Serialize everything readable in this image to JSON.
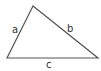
{
  "diagram": {
    "type": "triangle",
    "stroke_color": "#555555",
    "vertices": {
      "top": [
        33,
        6
      ],
      "bottom_left": [
        7,
        58
      ],
      "bottom_right": [
        98,
        58
      ]
    },
    "sides": [
      {
        "id": "a",
        "label": "a",
        "from": "bottom_left",
        "to": "top"
      },
      {
        "id": "b",
        "label": "b",
        "from": "top",
        "to": "bottom_right"
      },
      {
        "id": "c",
        "label": "c",
        "from": "bottom_left",
        "to": "bottom_right"
      }
    ]
  }
}
